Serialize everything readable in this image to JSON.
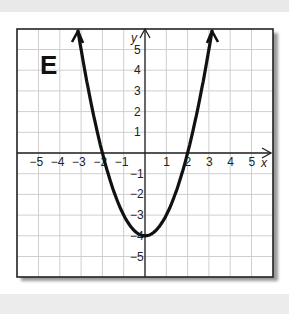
{
  "figure_label": "E",
  "axes": {
    "x_label": "x",
    "y_label": "y",
    "x_ticks": [
      "−5",
      "−4",
      "−3",
      "−2",
      "−1",
      "1",
      "2",
      "3",
      "4",
      "5"
    ],
    "y_ticks": [
      "5",
      "4",
      "3",
      "2",
      "1",
      "−1",
      "−2",
      "−3",
      "−4",
      "−5"
    ]
  },
  "colors": {
    "curve": "#111111",
    "grid": "#cfcfcf",
    "frame": "#222222"
  },
  "chart_data": {
    "type": "line",
    "title": "E",
    "xlabel": "x",
    "ylabel": "y",
    "function": "y = x^2 - 4",
    "x": [
      -3,
      -2.5,
      -2,
      -1.5,
      -1,
      -0.5,
      0,
      0.5,
      1,
      1.5,
      2,
      2.5,
      3
    ],
    "series": [
      {
        "name": "parabola",
        "values": [
          5,
          2.25,
          0,
          -1.75,
          -3,
          -3.75,
          -4,
          -3.75,
          -3,
          -1.75,
          0,
          2.25,
          5
        ]
      }
    ],
    "xlim": [
      -6,
      6
    ],
    "ylim": [
      -6,
      6
    ],
    "x_tick_labels": [
      -5,
      -4,
      -3,
      -2,
      -1,
      1,
      2,
      3,
      4,
      5
    ],
    "y_tick_labels": [
      -5,
      -4,
      -3,
      -2,
      -1,
      1,
      2,
      3,
      4,
      5
    ],
    "grid": true,
    "legend": "none",
    "annotations": [
      "vertex (0, -4)",
      "x-intercepts (-2, 0) and (2, 0)",
      "arrows at curve ends"
    ]
  }
}
